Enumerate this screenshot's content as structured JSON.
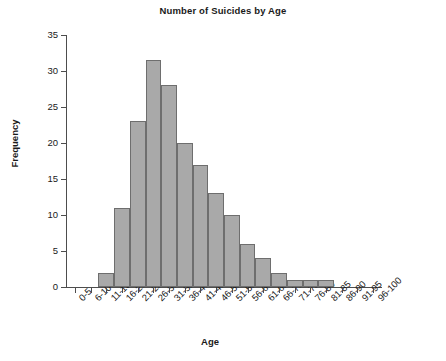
{
  "chart_data": {
    "type": "bar",
    "title": "Number of Suicides by Age",
    "xlabel": "Age",
    "ylabel": "Frequency",
    "categories": [
      "0-5",
      "6-10",
      "11-15",
      "16-20",
      "21-25",
      "26-30",
      "31-35",
      "36-40",
      "41-45",
      "46-50",
      "51-55",
      "56-60",
      "61-65",
      "66-70",
      "71-75",
      "76-80",
      "81-85",
      "86-90",
      "91-95",
      "96-100"
    ],
    "values": [
      0,
      0,
      2,
      11,
      23,
      31.5,
      28,
      20,
      17,
      13,
      10,
      6,
      4,
      2,
      1,
      1,
      1,
      0,
      0,
      0
    ],
    "ylim": [
      0,
      35
    ],
    "yticks": [
      0,
      5,
      10,
      15,
      20,
      25,
      30,
      35
    ],
    "ytick_labels": [
      "0",
      "5",
      "10",
      "15",
      "20",
      "25",
      "30",
      "35"
    ],
    "grid": false,
    "legend": "none",
    "bar_color": "#a9a9a9",
    "bar_border_color": "#6e6e6e",
    "axis_color": "#4d4d4d",
    "background": "#ffffff"
  }
}
